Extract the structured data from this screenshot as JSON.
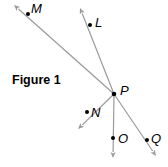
{
  "figure": {
    "title": "Figure 1",
    "vertex": {
      "label": "P",
      "x": 114,
      "y": 94
    },
    "rays": [
      {
        "id": "PM",
        "point_label": "M",
        "point": [
          28,
          14
        ],
        "tip": [
          14,
          5
        ],
        "label_pos": [
          31,
          13
        ]
      },
      {
        "id": "PL",
        "point_label": "L",
        "point": [
          90,
          25
        ],
        "tip": [
          80,
          8
        ],
        "label_pos": [
          95,
          27
        ]
      },
      {
        "id": "PN",
        "point_label": "N",
        "point": [
          87,
          112
        ],
        "tip": [
          78,
          129
        ],
        "label_pos": [
          91,
          117
        ]
      },
      {
        "id": "PO",
        "point_label": "O",
        "point": [
          113,
          138
        ],
        "tip": [
          113,
          158
        ],
        "label_pos": [
          118,
          143
        ]
      },
      {
        "id": "PQ",
        "point_label": "Q",
        "point": [
          147,
          140
        ],
        "tip": [
          156,
          156
        ],
        "label_pos": [
          151,
          143
        ]
      }
    ],
    "colors": {
      "ray": "#9a9a9a",
      "point": "#000000",
      "text": "#000000"
    }
  }
}
